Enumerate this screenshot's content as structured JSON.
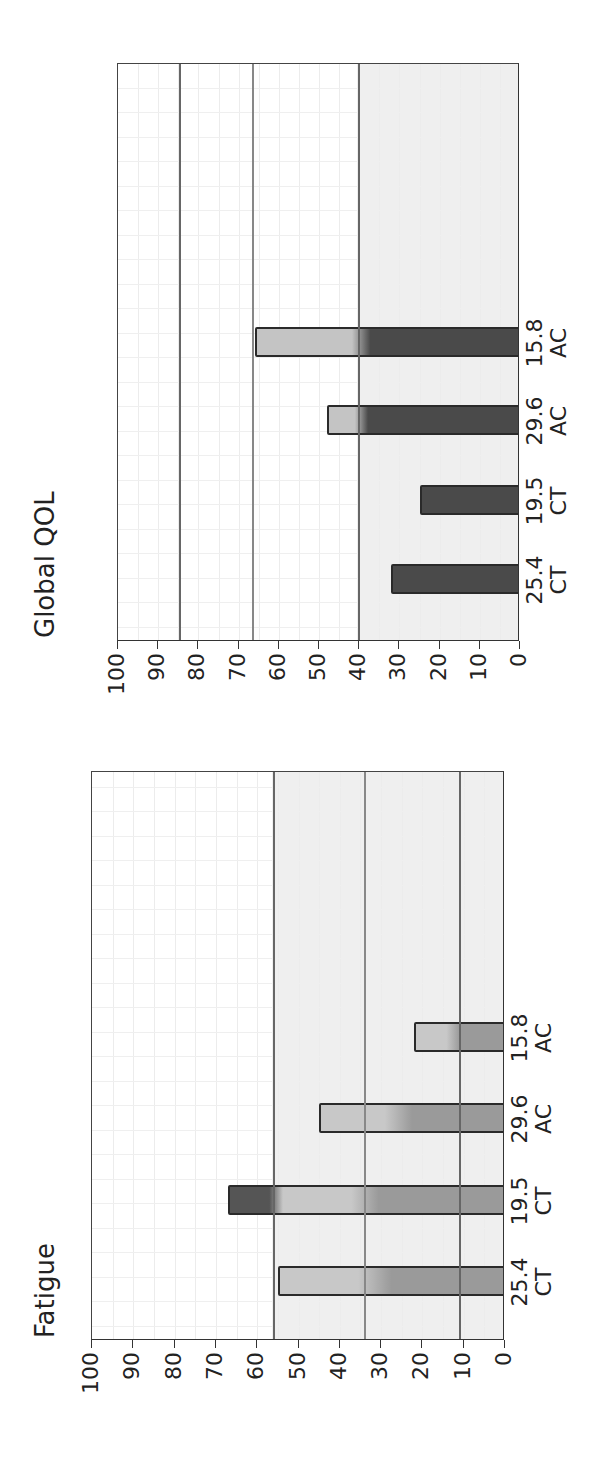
{
  "chart_data": [
    {
      "type": "bar",
      "title": "Fatigue",
      "categories": [
        "25.4\nCT",
        "19.5\nCT",
        "29.6\nAC",
        "15.8\nAC"
      ],
      "category_values": [
        "25.4",
        "19.5",
        "29.6",
        "15.8"
      ],
      "category_groups": [
        "CT",
        "CT",
        "AC",
        "AC"
      ],
      "values": [
        55,
        67,
        45,
        22
      ],
      "reference_lines": [
        56,
        34,
        11
      ],
      "xlabel": "",
      "ylabel": "",
      "ylim": [
        0,
        100
      ],
      "yticks": [
        0,
        10,
        20,
        30,
        40,
        50,
        60,
        70,
        80,
        90,
        100
      ],
      "grid": true,
      "orientation_note": "figure rotated 90 degrees counter-clockwise"
    },
    {
      "type": "bar",
      "title": "Global QOL",
      "categories": [
        "25.4\nCT",
        "19.5\nCT",
        "29.6\nAC",
        "15.8\nAC"
      ],
      "category_values": [
        "25.4",
        "19.5",
        "29.6",
        "15.8"
      ],
      "category_groups": [
        "CT",
        "CT",
        "AC",
        "AC"
      ],
      "values": [
        32,
        25,
        48,
        66
      ],
      "reference_lines": [
        84.5,
        66.5,
        40
      ],
      "xlabel": "",
      "ylabel": "",
      "ylim": [
        0,
        100
      ],
      "yticks": [
        0,
        10,
        20,
        30,
        40,
        50,
        60,
        70,
        80,
        90,
        100
      ],
      "grid": true,
      "orientation_note": "figure rotated 90 degrees counter-clockwise"
    }
  ],
  "panels": {
    "fatigue": {
      "title": "Fatigue",
      "yticks": [
        "100",
        "90",
        "80",
        "70",
        "60",
        "50",
        "40",
        "30",
        "20",
        "10",
        "0"
      ],
      "bars": [
        {
          "value_label": "25.4",
          "group_label": "CT"
        },
        {
          "value_label": "19.5",
          "group_label": "CT"
        },
        {
          "value_label": "29.6",
          "group_label": "AC"
        },
        {
          "value_label": "15.8",
          "group_label": "AC"
        }
      ]
    },
    "qol": {
      "title": "Global QOL",
      "yticks": [
        "100",
        "90",
        "80",
        "70",
        "60",
        "50",
        "40",
        "30",
        "20",
        "10",
        "0"
      ],
      "bars": [
        {
          "value_label": "25.4",
          "group_label": "CT"
        },
        {
          "value_label": "19.5",
          "group_label": "CT"
        },
        {
          "value_label": "29.6",
          "group_label": "AC"
        },
        {
          "value_label": "15.8",
          "group_label": "AC"
        }
      ]
    }
  },
  "colors": {
    "fatigue_bar_light": "#c8c8c8",
    "fatigue_bar_mid": "#9a9a9a",
    "fatigue_bar_dark": "#555555",
    "qol_bar_dark": "#4a4a4a",
    "qol_bar_light": "#c4c4c4",
    "shade": "#efefef",
    "reference_line": "#666666"
  }
}
